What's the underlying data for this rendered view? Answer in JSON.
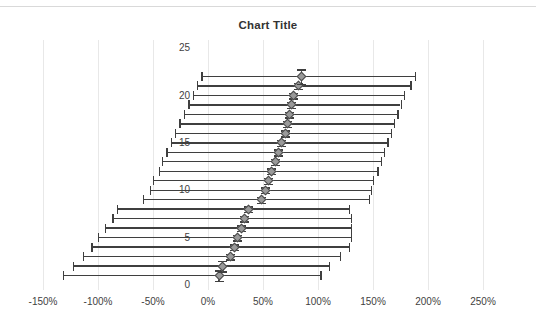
{
  "chart_data": {
    "type": "scatter",
    "title": "Chart Title",
    "xlabel": "",
    "ylabel": "",
    "xlim": [
      -1.75,
      2.75
    ],
    "ylim": [
      0,
      25
    ],
    "grid": true,
    "legend": false,
    "x_tick_labels": [
      "-150%",
      "-100%",
      "-50%",
      "0%",
      "50%",
      "100%",
      "150%",
      "200%",
      "250%"
    ],
    "x_tick_values": [
      -1.5,
      -1.0,
      -0.5,
      0.0,
      0.5,
      1.0,
      1.5,
      2.0,
      2.5
    ],
    "y_tick_labels": [
      "0",
      "5",
      "10",
      "15",
      "20",
      "25"
    ],
    "y_tick_values": [
      0,
      5,
      10,
      15,
      20,
      25
    ],
    "marker": "diamond",
    "marker_color": "#9a9a9a",
    "marker_edge_color": "#4a4a4a",
    "error_bar_color": "#3f3f3f",
    "x_error_bars": true,
    "y_error_bars": true,
    "points": [
      {
        "y": 1,
        "x": 0.1,
        "x_low": -1.32,
        "x_high": 1.02,
        "y_err": 0.55
      },
      {
        "y": 2,
        "x": 0.13,
        "x_low": -1.23,
        "x_high": 1.1,
        "y_err": 0.55
      },
      {
        "y": 3,
        "x": 0.2,
        "x_low": -1.14,
        "x_high": 1.2,
        "y_err": 0.3
      },
      {
        "y": 4,
        "x": 0.24,
        "x_low": -1.06,
        "x_high": 1.28,
        "y_err": 0.3
      },
      {
        "y": 5,
        "x": 0.27,
        "x_low": -1.0,
        "x_high": 1.3,
        "y_err": 0.3
      },
      {
        "y": 6,
        "x": 0.3,
        "x_low": -0.94,
        "x_high": 1.3,
        "y_err": 0.3
      },
      {
        "y": 7,
        "x": 0.33,
        "x_low": -0.87,
        "x_high": 1.3,
        "y_err": 0.3
      },
      {
        "y": 8,
        "x": 0.37,
        "x_low": -0.83,
        "x_high": 1.28,
        "y_err": 0.3
      },
      {
        "y": 9,
        "x": 0.49,
        "x_low": -0.59,
        "x_high": 1.46,
        "y_err": 0.3
      },
      {
        "y": 10,
        "x": 0.52,
        "x_low": -0.53,
        "x_high": 1.48,
        "y_err": 0.3
      },
      {
        "y": 11,
        "x": 0.55,
        "x_low": -0.5,
        "x_high": 1.5,
        "y_err": 0.3
      },
      {
        "y": 12,
        "x": 0.58,
        "x_low": -0.45,
        "x_high": 1.54,
        "y_err": 0.3
      },
      {
        "y": 13,
        "x": 0.61,
        "x_low": -0.42,
        "x_high": 1.57,
        "y_err": 0.3
      },
      {
        "y": 14,
        "x": 0.64,
        "x_low": -0.38,
        "x_high": 1.6,
        "y_err": 0.3
      },
      {
        "y": 15,
        "x": 0.67,
        "x_low": -0.34,
        "x_high": 1.63,
        "y_err": 0.3
      },
      {
        "y": 16,
        "x": 0.7,
        "x_low": -0.3,
        "x_high": 1.66,
        "y_err": 0.3
      },
      {
        "y": 17,
        "x": 0.72,
        "x_low": -0.26,
        "x_high": 1.69,
        "y_err": 0.3
      },
      {
        "y": 18,
        "x": 0.74,
        "x_low": -0.22,
        "x_high": 1.72,
        "y_err": 0.3
      },
      {
        "y": 19,
        "x": 0.76,
        "x_low": -0.18,
        "x_high": 1.75,
        "y_err": 0.3
      },
      {
        "y": 20,
        "x": 0.78,
        "x_low": -0.14,
        "x_high": 1.78,
        "y_err": 0.3
      },
      {
        "y": 21,
        "x": 0.82,
        "x_low": -0.1,
        "x_high": 1.84,
        "y_err": 0.3
      },
      {
        "y": 22,
        "x": 0.85,
        "x_low": -0.06,
        "x_high": 1.88,
        "y_err": 0.75
      }
    ]
  },
  "axes": {
    "x_tick_px": [
      43,
      98,
      153,
      208,
      263,
      318,
      373,
      428,
      483
    ],
    "y_label_positions_px": [
      285,
      238,
      190,
      143,
      96,
      48
    ]
  },
  "icons": {
    "marker": "diamond-marker-icon"
  }
}
